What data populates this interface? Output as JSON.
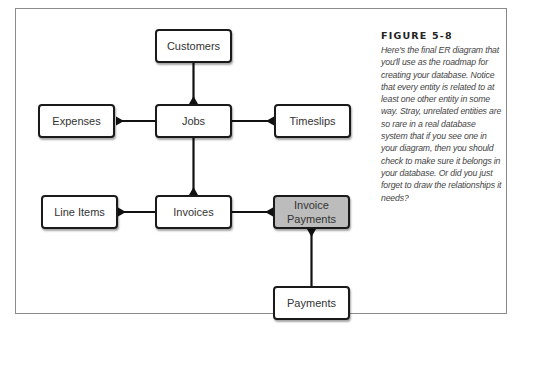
{
  "figure": {
    "label": "FIGURE 5-8",
    "caption": "Here's the final ER diagram that you'll use as the roadmap for creating your database. Notice that every entity is related to at least one other entity in some way. Stray, unrelated entities are so rare in a real database system that if you see one in your diagram, then you should check to make sure it belongs in your database. Or did you just forget to draw the relationships it needs?"
  },
  "entities": {
    "customers": {
      "label": "Customers"
    },
    "expenses": {
      "label": "Expenses"
    },
    "jobs": {
      "label": "Jobs"
    },
    "timeslips": {
      "label": "Timeslips"
    },
    "line_items": {
      "label": "Line Items"
    },
    "invoices": {
      "label": "Invoices"
    },
    "invoice_payments": {
      "label": "Invoice\nPayments",
      "fill": "#bcbcbc"
    },
    "payments": {
      "label": "Payments"
    }
  },
  "relationships": [
    {
      "from": "Customers",
      "to": "Jobs",
      "type": "one-to-many"
    },
    {
      "from": "Jobs",
      "to": "Expenses",
      "type": "one-to-many"
    },
    {
      "from": "Jobs",
      "to": "Timeslips",
      "type": "one-to-many"
    },
    {
      "from": "Jobs",
      "to": "Invoices",
      "type": "one-to-many"
    },
    {
      "from": "Invoices",
      "to": "Line Items",
      "type": "one-to-many"
    },
    {
      "from": "Invoices",
      "to": "Invoice Payments",
      "type": "one-to-many"
    },
    {
      "from": "Payments",
      "to": "Invoice Payments",
      "type": "one-to-many"
    }
  ],
  "colors": {
    "line": "#111111",
    "entity_border": "#1a1a1a",
    "junction_fill": "#bcbcbc",
    "frame_border": "#8a8a8a"
  }
}
